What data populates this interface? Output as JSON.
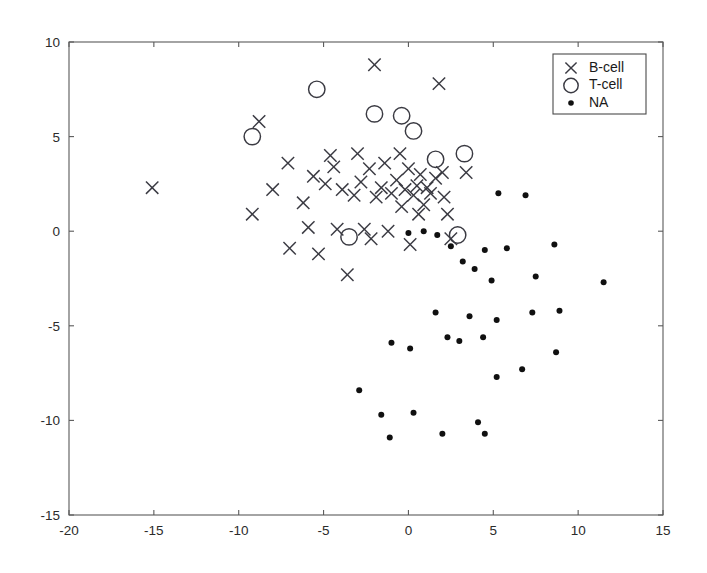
{
  "chart_data": {
    "type": "scatter",
    "title": "",
    "subtitle": "",
    "xlabel": "",
    "ylabel": "",
    "xlim": [
      -20,
      15
    ],
    "ylim": [
      -15,
      10
    ],
    "xticks": [
      -20,
      -15,
      -10,
      -5,
      0,
      5,
      10,
      15
    ],
    "yticks": [
      -15,
      -10,
      -5,
      0,
      5,
      10
    ],
    "xticklabels": [
      "-20",
      "-15",
      "-10",
      "-5",
      "0",
      "5",
      "10",
      "15"
    ],
    "yticklabels": [
      "-15",
      "-10",
      "-5",
      "0",
      "5",
      "10"
    ],
    "grid": false,
    "legend_position": "upper right",
    "marker_color": "#3a3a42",
    "dot_color": "#101010",
    "axis_color": "#5a5a5a",
    "background": "#ffffff",
    "series": [
      {
        "name": "B-cell",
        "marker": "x",
        "points": [
          [
            -15.1,
            2.3
          ],
          [
            -8.8,
            5.8
          ],
          [
            -9.2,
            0.9
          ],
          [
            -8.0,
            2.2
          ],
          [
            -7.1,
            3.6
          ],
          [
            -7.0,
            -0.9
          ],
          [
            -6.2,
            1.5
          ],
          [
            -5.9,
            0.2
          ],
          [
            -5.6,
            2.9
          ],
          [
            -5.3,
            -1.2
          ],
          [
            -4.9,
            2.5
          ],
          [
            -4.6,
            4.0
          ],
          [
            -4.4,
            3.4
          ],
          [
            -4.2,
            0.1
          ],
          [
            -3.9,
            2.2
          ],
          [
            -3.6,
            -2.3
          ],
          [
            -3.2,
            1.9
          ],
          [
            -3.0,
            4.1
          ],
          [
            -2.8,
            2.6
          ],
          [
            -2.6,
            0.1
          ],
          [
            -2.3,
            3.3
          ],
          [
            -2.0,
            8.8
          ],
          [
            -1.9,
            1.8
          ],
          [
            -1.6,
            2.3
          ],
          [
            -1.4,
            3.6
          ],
          [
            -1.2,
            0.0
          ],
          [
            -1.0,
            2.0
          ],
          [
            -0.7,
            2.7
          ],
          [
            -0.5,
            4.1
          ],
          [
            -0.4,
            1.3
          ],
          [
            -0.2,
            2.2
          ],
          [
            0.0,
            3.3
          ],
          [
            0.1,
            -0.7
          ],
          [
            0.3,
            1.9
          ],
          [
            0.5,
            2.4
          ],
          [
            0.7,
            3.0
          ],
          [
            0.9,
            1.4
          ],
          [
            1.1,
            2.3
          ],
          [
            1.3,
            2.0
          ],
          [
            1.6,
            2.8
          ],
          [
            1.8,
            7.8
          ],
          [
            2.0,
            3.1
          ],
          [
            2.1,
            1.8
          ],
          [
            2.3,
            0.9
          ],
          [
            2.5,
            -0.4
          ],
          [
            3.4,
            3.1
          ],
          [
            0.6,
            0.9
          ],
          [
            -2.2,
            -0.4
          ]
        ]
      },
      {
        "name": "T-cell",
        "marker": "o",
        "points": [
          [
            -9.2,
            5.0
          ],
          [
            -5.4,
            7.5
          ],
          [
            -2.0,
            6.2
          ],
          [
            -0.4,
            6.1
          ],
          [
            0.3,
            5.3
          ],
          [
            1.6,
            3.8
          ],
          [
            3.3,
            4.1
          ],
          [
            -3.5,
            -0.3
          ],
          [
            2.9,
            -0.2
          ]
        ]
      },
      {
        "name": "NA",
        "marker": ".",
        "points": [
          [
            0.9,
            0.0
          ],
          [
            1.7,
            -0.2
          ],
          [
            5.3,
            2.0
          ],
          [
            6.9,
            1.9
          ],
          [
            2.5,
            -0.8
          ],
          [
            3.2,
            -1.6
          ],
          [
            4.5,
            -1.0
          ],
          [
            5.8,
            -0.9
          ],
          [
            8.6,
            -0.7
          ],
          [
            3.9,
            -2.0
          ],
          [
            4.9,
            -2.6
          ],
          [
            7.5,
            -2.4
          ],
          [
            11.5,
            -2.7
          ],
          [
            1.6,
            -4.3
          ],
          [
            3.6,
            -4.5
          ],
          [
            5.2,
            -4.7
          ],
          [
            7.3,
            -4.3
          ],
          [
            8.9,
            -4.2
          ],
          [
            0.1,
            -6.2
          ],
          [
            2.3,
            -5.6
          ],
          [
            3.0,
            -5.8
          ],
          [
            4.4,
            -5.6
          ],
          [
            8.7,
            -6.4
          ],
          [
            -1.0,
            -5.9
          ],
          [
            -2.9,
            -8.4
          ],
          [
            -1.6,
            -9.7
          ],
          [
            0.3,
            -9.6
          ],
          [
            5.2,
            -7.7
          ],
          [
            6.7,
            -7.3
          ],
          [
            -1.1,
            -10.9
          ],
          [
            2.0,
            -10.7
          ],
          [
            4.1,
            -10.1
          ],
          [
            4.5,
            -10.7
          ],
          [
            0.0,
            -0.1
          ]
        ]
      }
    ]
  },
  "legend": {
    "entries": [
      {
        "label": "B-cell",
        "marker": "x"
      },
      {
        "label": "T-cell",
        "marker": "o"
      },
      {
        "label": "NA",
        "marker": "."
      }
    ]
  }
}
